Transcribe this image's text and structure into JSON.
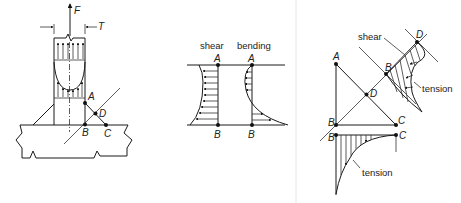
{
  "figure": {
    "panel_weld": {
      "force_label": "F",
      "thickness_label": "T",
      "points": {
        "A": "A",
        "B": "B",
        "C": "C",
        "D": "D"
      }
    },
    "panel_stress_distribution": {
      "shear_label": "shear",
      "bending_label": "bending",
      "shear_top": "A",
      "shear_bottom": "B",
      "bending_top": "A",
      "bending_bottom": "B"
    },
    "panel_throat": {
      "points": {
        "A": "A",
        "B": "B",
        "C": "C",
        "D": "D"
      },
      "rotated_B": "B",
      "rotated_D": "D",
      "lower_B": "B",
      "lower_C": "C",
      "shear_label": "shear",
      "tension_upper_label": "tension",
      "tension_lower_label": "tension"
    }
  },
  "colors": {
    "line": "#1a1a1a",
    "background": "#ffffff",
    "divider": "#e6e6e6"
  }
}
